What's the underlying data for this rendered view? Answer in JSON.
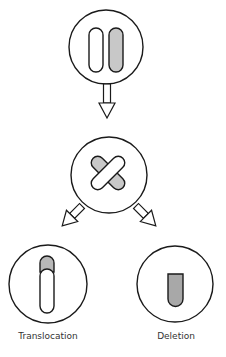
{
  "diagram": {
    "type": "chromosome-mutation-flow",
    "colors": {
      "stroke": "#1a1a1a",
      "fill_shaded": "#c8c8c8",
      "fill_shaded_dark": "#a8a8a8",
      "background": "#ffffff"
    },
    "nodes": [
      {
        "id": "pair",
        "description": "two homologous chromosomes, one white, one shaded"
      },
      {
        "id": "crossing",
        "description": "two chromosomes crossing over"
      },
      {
        "id": "translocation",
        "description": "white chromosome with shaded segment attached on top"
      },
      {
        "id": "deletion",
        "description": "shortened shaded chromosome"
      }
    ],
    "labels": {
      "translocation": "Translocation",
      "deletion": "Deletion"
    }
  }
}
